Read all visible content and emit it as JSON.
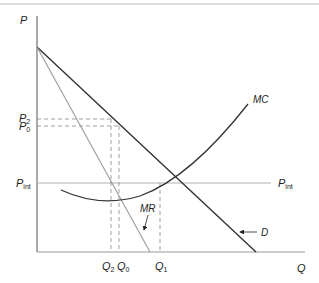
{
  "diagram": {
    "axes": {
      "y_label": "P",
      "x_label": "Q"
    },
    "curves": {
      "demand": {
        "label": "D",
        "color": "#333333"
      },
      "marginal_revenue": {
        "label": "MR",
        "color": "#9a9a9a"
      },
      "marginal_cost": {
        "label": "MC",
        "color": "#333333"
      },
      "world_price": {
        "label": "P",
        "label_sub": "int",
        "color": "#b0b0b0"
      }
    },
    "price_labels": [
      {
        "main": "P",
        "sub": "2"
      },
      {
        "main": "P",
        "sub": "0"
      },
      {
        "main": "P",
        "sub": "int"
      }
    ],
    "quantity_labels": [
      {
        "main": "Q",
        "sub": "2"
      },
      {
        "main": "Q",
        "sub": "0"
      },
      {
        "main": "Q",
        "sub": "1"
      }
    ]
  }
}
